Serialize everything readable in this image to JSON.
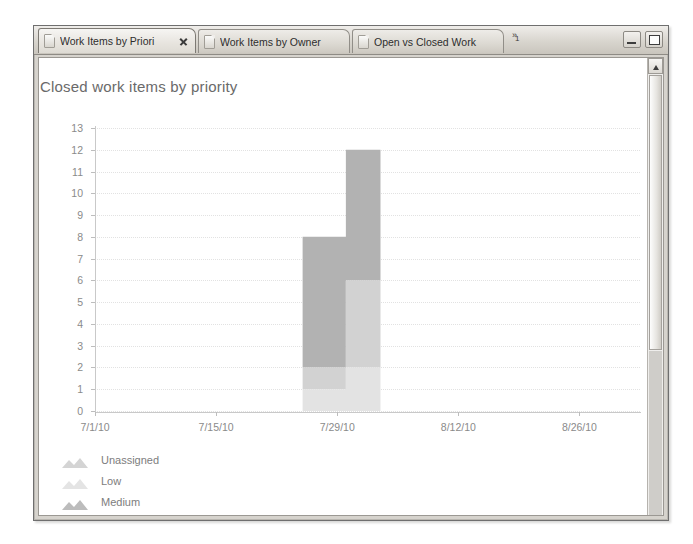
{
  "window": {
    "tabs": [
      {
        "label": "Work Items by Priori",
        "icon": "report-icon",
        "active": true,
        "closable": true
      },
      {
        "label": "Work Items by Owner",
        "icon": "report-icon",
        "active": false,
        "closable": false
      },
      {
        "label": "Open vs Closed Work",
        "icon": "report-icon",
        "active": false,
        "closable": false
      }
    ],
    "tab_overflow": {
      "glyph": "»",
      "count": "1"
    },
    "buttons": {
      "minimize": "minimize-button",
      "restore": "restore-button"
    },
    "scrollbar": {
      "up_arrow": "scroll-up-icon"
    }
  },
  "chart_data": {
    "type": "area",
    "title": "Closed work items by priority",
    "xlabel": "",
    "ylabel": "",
    "grid": true,
    "legend_position": "bottom-left",
    "ylim": [
      0,
      13
    ],
    "yticks": [
      "0",
      "1",
      "2",
      "3",
      "4",
      "5",
      "6",
      "7",
      "8",
      "9",
      "10",
      "11",
      "12",
      "13"
    ],
    "xticks": [
      "7/1/10",
      "7/15/10",
      "7/29/10",
      "8/12/10",
      "8/26/10"
    ],
    "xlim": [
      "7/1/10",
      "9/2/10"
    ],
    "stacked": true,
    "step": true,
    "colors": {
      "Unassigned": "#e3e3e3",
      "Low": "#d2d2d2",
      "Medium": "#b2b2b2"
    },
    "x": [
      "7/25/10",
      "7/30/10",
      "8/3/10"
    ],
    "series": [
      {
        "name": "Unassigned",
        "values": [
          1,
          2,
          2
        ],
        "color": "#e3e3e3"
      },
      {
        "name": "Low",
        "values": [
          1,
          4,
          4
        ],
        "color": "#d2d2d2"
      },
      {
        "name": "Medium",
        "values": [
          6,
          6,
          6
        ],
        "color": "#b2b2b2"
      }
    ],
    "totals": [
      8,
      12,
      12
    ],
    "annotations": []
  },
  "legend": [
    {
      "label": "Unassigned",
      "color": "#d8d8d8"
    },
    {
      "label": "Low",
      "color": "#e0e0e0"
    },
    {
      "label": "Medium",
      "color": "#c2c2c2"
    }
  ]
}
